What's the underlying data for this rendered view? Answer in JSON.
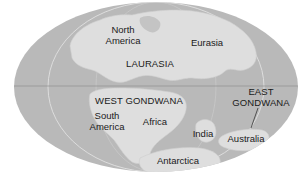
{
  "map": {
    "type": "paleogeographic-world-map",
    "projection": "elliptical",
    "colors": {
      "background": "#ffffff",
      "ocean": "#b9b9b9",
      "land": "#dedede",
      "land_edge": "#cfcfcf",
      "meridian": "#e8e8e8",
      "equator": "#8f8f8f",
      "text": "#1a1a1a"
    },
    "labels": {
      "north_america_line1": "North",
      "north_america_line2": "America",
      "eurasia": "Eurasia",
      "laurasia": "LAURASIA",
      "west_gondwana": "WEST GONDWANA",
      "south_america_line1": "South",
      "south_america_line2": "America",
      "africa": "Africa",
      "east_gondwana_line1": "EAST",
      "east_gondwana_line2": "GONDWANA",
      "india": "India",
      "australia": "Australia",
      "antarctica": "Antarctica"
    }
  }
}
